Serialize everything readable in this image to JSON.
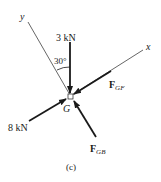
{
  "diagram": {
    "type": "free-body-diagram",
    "caption": "(c)",
    "point": {
      "label": "G"
    },
    "axes": {
      "x_label": "x",
      "y_label": "y"
    },
    "angle": {
      "label": "30°",
      "between": [
        "y-axis",
        "3 kN force"
      ]
    },
    "forces": [
      {
        "id": "f3kn",
        "label": "3 kN",
        "direction": "vertical, toward G (downward)"
      },
      {
        "id": "fgf",
        "label_main": "F",
        "label_sub": "GF",
        "direction": "along x-axis, toward G"
      },
      {
        "id": "f8kn",
        "label": "8 kN",
        "direction": "from lower-left, toward G"
      },
      {
        "id": "fgb",
        "label_main": "F",
        "label_sub": "GB",
        "direction": "from lower-right, toward G"
      }
    ],
    "colors": {
      "ink": "#1a1a1a",
      "axis": "#555555",
      "background": "#ffffff"
    }
  }
}
